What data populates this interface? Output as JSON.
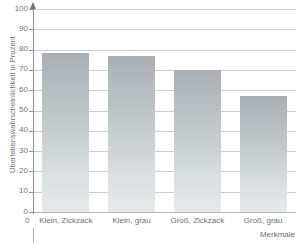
{
  "chart_data": {
    "type": "bar",
    "title": "",
    "subtitle": "",
    "xlabel": "Merkmale",
    "ylabel": "Überlebenswahrscheinlichkeit in Prozent",
    "categories": [
      "Klein, Zickzack",
      "Klein, grau",
      "Groß, Zickzack",
      "Groß, grau"
    ],
    "values": [
      78.5,
      77,
      70,
      57
    ],
    "ylim": [
      0,
      100
    ],
    "yticks": [
      0,
      10,
      20,
      30,
      40,
      50,
      60,
      70,
      80,
      90,
      100
    ],
    "ytick_labels": [
      "0",
      "10",
      "20",
      "30",
      "40",
      "50",
      "60",
      "70",
      "80",
      "90",
      "100"
    ],
    "x_origin_label": "0",
    "grid": true,
    "grid_axis": "y",
    "legend": false,
    "legend_position": "none",
    "bar_color_top": "#a8aeb1",
    "bar_color_bottom": "#e6eaeb",
    "gridline_color": "#c9cdd0",
    "axis_color": "#8d9194",
    "text_color": "#6f6f6f",
    "background": "#ffffff"
  },
  "axes": {
    "y_title": "Überlebenswahrscheinlichkeit in Prozent",
    "x_title": "Merkmale",
    "origin_label": "0"
  },
  "ticks": {
    "y": [
      {
        "label": "100",
        "value": 100
      },
      {
        "label": "90",
        "value": 90
      },
      {
        "label": "80",
        "value": 80
      },
      {
        "label": "70",
        "value": 70
      },
      {
        "label": "60",
        "value": 60
      },
      {
        "label": "50",
        "value": 50
      },
      {
        "label": "40",
        "value": 40
      },
      {
        "label": "30",
        "value": 30
      },
      {
        "label": "20",
        "value": 20
      },
      {
        "label": "10",
        "value": 10
      },
      {
        "label": "0",
        "value": 0
      }
    ]
  },
  "bars": [
    {
      "label": "Klein, Zickzack",
      "value": 78.5
    },
    {
      "label": "Klein, grau",
      "value": 77
    },
    {
      "label": "Groß, Zickzack",
      "value": 70
    },
    {
      "label": "Groß, grau",
      "value": 57
    }
  ]
}
